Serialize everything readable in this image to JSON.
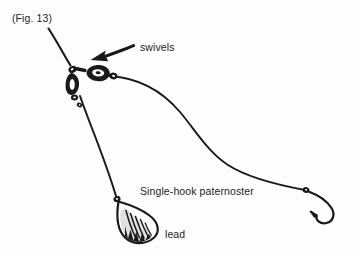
{
  "figure": {
    "caption": "(Fig. 13)",
    "title_label": "Single-hook paternoster",
    "type": "line-drawing",
    "background_color": "#fdfdfd",
    "ink_color": "#1a1a1a"
  },
  "labels": {
    "fig_number": "(Fig. 13)",
    "swivels": "swivels",
    "rig_name": "Single-hook paternoster",
    "lead": "lead"
  },
  "annotations": {
    "arrow": {
      "name": "swivels-arrow",
      "points_to": "swivels",
      "direction": "left-down"
    }
  },
  "components": [
    {
      "name": "main-line",
      "label": "main line"
    },
    {
      "name": "swivel-cluster",
      "label": "swivels"
    },
    {
      "name": "snood-line",
      "label": "snood"
    },
    {
      "name": "hook",
      "label": "hook"
    },
    {
      "name": "lead-drop-line",
      "label": "lead link"
    },
    {
      "name": "lead-weight",
      "label": "lead"
    }
  ]
}
